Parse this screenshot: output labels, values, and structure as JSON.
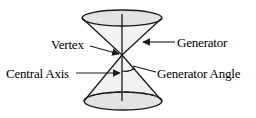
{
  "figure": {
    "name": "double-cone-geometry-diagram",
    "background_color": "#ffffff",
    "line_color": "#1a1a1a",
    "text_color": "#000000",
    "surface_fill_color": "#e3e3e3"
  },
  "labels": {
    "vertex": "Vertex",
    "central_axis": "Central Axis",
    "generator": "Generator",
    "generator_angle": "Generator Angle"
  },
  "geometry": {
    "vertex_point": {
      "x": 122,
      "y": 55
    },
    "axis_top": {
      "x": 122,
      "y": 14
    },
    "axis_bottom": {
      "x": 122,
      "y": 101
    },
    "top_ellipse": {
      "cx": 122,
      "cy": 18,
      "rx": 40,
      "ry": 8
    },
    "bottom_ellipse": {
      "cx": 123,
      "cy": 101,
      "rx": 39,
      "ry": 9
    },
    "angle_arc_radius": 16
  }
}
